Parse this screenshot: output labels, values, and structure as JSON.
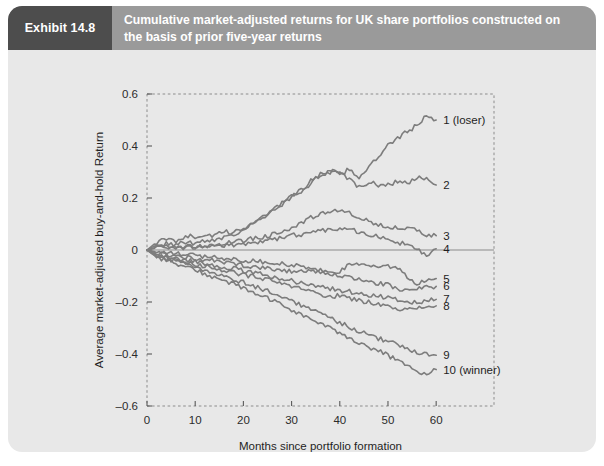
{
  "exhibit": {
    "tag": "Exhibit 14.8",
    "title": "Cumulative market-adjusted returns for UK share portfolios constructed on the basis of prior five-year returns"
  },
  "colors": {
    "header_band": "#9a9a9a",
    "tag_block": "#4d4d4d",
    "card_background": "#e8e8e8",
    "line": "#7d7d7d",
    "zero_line": "#8a8a8a",
    "border": "#8c8c8c"
  },
  "chart_data": {
    "type": "line",
    "title": "",
    "xlabel": "Months since portfolio formation",
    "ylabel": "Average market-adjusted buy-and-hold Return",
    "xlim": [
      0,
      72
    ],
    "ylim": [
      -0.6,
      0.6
    ],
    "xticks": [
      0,
      10,
      20,
      30,
      40,
      50,
      60
    ],
    "xticklabels": [
      "0",
      "10",
      "20",
      "30",
      "40",
      "50",
      "60"
    ],
    "yticks": [
      0.6,
      0.4,
      0.2,
      0,
      -0.2,
      -0.4,
      -0.6
    ],
    "yticklabels": [
      "0.6",
      "0.4",
      "0.2",
      "0",
      "–0.2",
      "–0.4",
      "–0.6"
    ],
    "grid": false,
    "legend_position": "right-inline",
    "zero_reference_line": 0,
    "x": [
      0,
      2,
      4,
      6,
      8,
      10,
      12,
      14,
      16,
      18,
      20,
      22,
      24,
      26,
      28,
      30,
      32,
      34,
      36,
      38,
      40,
      42,
      44,
      46,
      48,
      50,
      52,
      54,
      56,
      58,
      60
    ],
    "series": [
      {
        "name": "1 (loser)",
        "label": "1 (loser)",
        "end_value": 0.5,
        "values": [
          0,
          0.03,
          0.04,
          0.035,
          0.055,
          0.05,
          0.06,
          0.055,
          0.07,
          0.065,
          0.085,
          0.105,
          0.13,
          0.15,
          0.175,
          0.205,
          0.225,
          0.265,
          0.29,
          0.3,
          0.29,
          0.31,
          0.28,
          0.32,
          0.355,
          0.4,
          0.43,
          0.455,
          0.48,
          0.515,
          0.5
        ]
      },
      {
        "name": "2",
        "label": "2",
        "end_value": 0.25,
        "values": [
          0,
          0.02,
          0.025,
          0.02,
          0.03,
          0.025,
          0.035,
          0.04,
          0.05,
          0.06,
          0.08,
          0.1,
          0.12,
          0.15,
          0.18,
          0.205,
          0.23,
          0.255,
          0.29,
          0.3,
          0.305,
          0.27,
          0.24,
          0.26,
          0.25,
          0.25,
          0.265,
          0.255,
          0.28,
          0.27,
          0.25
        ]
      },
      {
        "name": "3",
        "label": "3",
        "end_value": 0.055,
        "values": [
          0,
          0.012,
          0.015,
          0.01,
          0.015,
          0.012,
          0.018,
          0.02,
          0.025,
          0.03,
          0.035,
          0.045,
          0.05,
          0.06,
          0.075,
          0.085,
          0.1,
          0.125,
          0.135,
          0.15,
          0.155,
          0.14,
          0.12,
          0.11,
          0.095,
          0.09,
          0.09,
          0.08,
          0.075,
          0.06,
          0.055
        ]
      },
      {
        "name": "4",
        "label": "4",
        "end_value": 0.005,
        "values": [
          0,
          0.008,
          0.01,
          0.005,
          0.01,
          0.008,
          0.012,
          0.015,
          0.018,
          0.02,
          0.025,
          0.028,
          0.03,
          0.04,
          0.05,
          0.055,
          0.06,
          0.07,
          0.075,
          0.08,
          0.085,
          0.08,
          0.07,
          0.06,
          0.05,
          0.04,
          0.03,
          0.02,
          0.0,
          -0.02,
          0.005
        ]
      },
      {
        "name": "5",
        "label": "5",
        "end_value": -0.11,
        "values": [
          0,
          -0.008,
          -0.012,
          -0.015,
          -0.018,
          -0.02,
          -0.025,
          -0.028,
          -0.032,
          -0.035,
          -0.04,
          -0.042,
          -0.045,
          -0.048,
          -0.052,
          -0.058,
          -0.065,
          -0.07,
          -0.08,
          -0.09,
          -0.08,
          -0.06,
          -0.055,
          -0.06,
          -0.06,
          -0.065,
          -0.07,
          -0.1,
          -0.13,
          -0.115,
          -0.11
        ]
      },
      {
        "name": "6",
        "label": "6",
        "end_value": -0.14,
        "values": [
          0,
          -0.012,
          -0.018,
          -0.022,
          -0.028,
          -0.032,
          -0.038,
          -0.042,
          -0.048,
          -0.052,
          -0.058,
          -0.062,
          -0.068,
          -0.072,
          -0.078,
          -0.082,
          -0.075,
          -0.082,
          -0.09,
          -0.095,
          -0.1,
          -0.105,
          -0.11,
          -0.12,
          -0.128,
          -0.135,
          -0.15,
          -0.158,
          -0.15,
          -0.142,
          -0.14
        ]
      },
      {
        "name": "7",
        "label": "7",
        "end_value": -0.19,
        "values": [
          0,
          -0.018,
          -0.025,
          -0.032,
          -0.038,
          -0.045,
          -0.052,
          -0.058,
          -0.065,
          -0.072,
          -0.08,
          -0.088,
          -0.095,
          -0.102,
          -0.11,
          -0.118,
          -0.125,
          -0.132,
          -0.14,
          -0.148,
          -0.155,
          -0.16,
          -0.168,
          -0.172,
          -0.178,
          -0.182,
          -0.19,
          -0.198,
          -0.205,
          -0.195,
          -0.19
        ]
      },
      {
        "name": "8",
        "label": "8",
        "end_value": -0.215,
        "values": [
          0,
          -0.022,
          -0.03,
          -0.038,
          -0.045,
          -0.055,
          -0.062,
          -0.07,
          -0.078,
          -0.085,
          -0.095,
          -0.102,
          -0.112,
          -0.12,
          -0.13,
          -0.14,
          -0.15,
          -0.16,
          -0.17,
          -0.18,
          -0.175,
          -0.185,
          -0.195,
          -0.2,
          -0.205,
          -0.215,
          -0.225,
          -0.23,
          -0.225,
          -0.218,
          -0.215
        ]
      },
      {
        "name": "9",
        "label": "9",
        "end_value": -0.405,
        "values": [
          0,
          -0.025,
          -0.035,
          -0.045,
          -0.055,
          -0.068,
          -0.078,
          -0.09,
          -0.1,
          -0.112,
          -0.125,
          -0.138,
          -0.15,
          -0.165,
          -0.18,
          -0.195,
          -0.212,
          -0.228,
          -0.245,
          -0.262,
          -0.278,
          -0.295,
          -0.312,
          -0.325,
          -0.34,
          -0.352,
          -0.365,
          -0.378,
          -0.392,
          -0.4,
          -0.405
        ]
      },
      {
        "name": "10 (winner)",
        "label": "10 (winner)",
        "end_value": -0.46,
        "values": [
          0,
          -0.028,
          -0.04,
          -0.052,
          -0.065,
          -0.078,
          -0.092,
          -0.105,
          -0.118,
          -0.132,
          -0.148,
          -0.162,
          -0.178,
          -0.195,
          -0.212,
          -0.23,
          -0.248,
          -0.265,
          -0.285,
          -0.302,
          -0.32,
          -0.338,
          -0.355,
          -0.372,
          -0.388,
          -0.405,
          -0.425,
          -0.448,
          -0.468,
          -0.472,
          -0.46
        ]
      }
    ]
  }
}
